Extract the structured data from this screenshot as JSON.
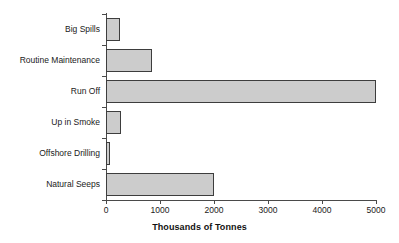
{
  "chart_data": {
    "type": "bar",
    "orientation": "horizontal",
    "title": "",
    "xlabel": "Thousands of Tonnes",
    "ylabel": "",
    "categories": [
      "Big Spills",
      "Routine Maintenance",
      "Run Off",
      "Up in Smoke",
      "Offshore Drilling",
      "Natural Seeps"
    ],
    "values": [
      260,
      850,
      5000,
      270,
      70,
      2000
    ],
    "xlim": [
      0,
      5000
    ],
    "xticks": [
      0,
      1000,
      2000,
      3000,
      4000,
      5000
    ],
    "xtick_labels": [
      "0",
      "1000",
      "2000",
      "3000",
      "4000",
      "5000"
    ],
    "grid": false,
    "legend": false,
    "bar_fill_color": "#cccccc",
    "bar_edge_color": "#3d3d3d",
    "axis_color": "#4a4a4a"
  }
}
